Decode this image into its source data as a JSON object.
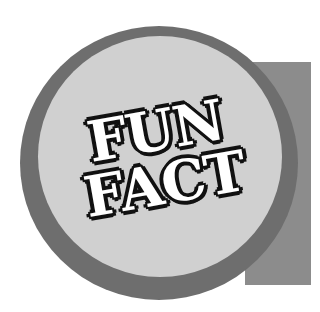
{
  "badge": {
    "line1": "FUN",
    "line2": "FACT"
  },
  "colors": {
    "ring": "#6e6e6e",
    "disc": "#d0d0d0",
    "panel": "#8c8c8c",
    "text_fill": "#ffffff",
    "text_outline": "#111111"
  }
}
